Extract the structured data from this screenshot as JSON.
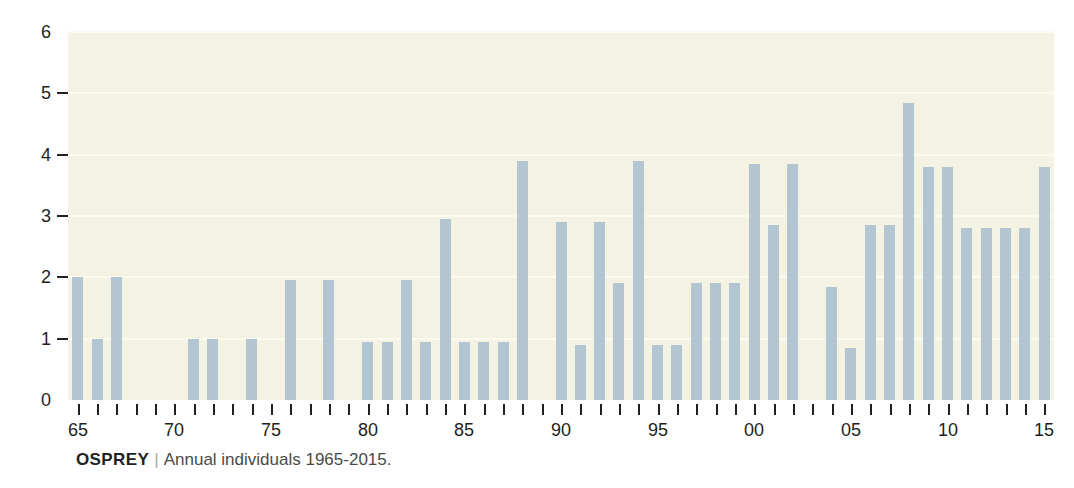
{
  "caption": {
    "species": "OSPREY",
    "separator": "|",
    "description": "Annual individuals 1965-2015."
  },
  "colors": {
    "bar": "#b3c5d0",
    "plot_background": "#f4f3e3",
    "gridline": "#fbfaf0",
    "axis_text": "#231f20",
    "page_background": "#ffffff"
  },
  "chart_data": {
    "type": "bar",
    "xlabel": "",
    "ylabel": "",
    "ylim": [
      0,
      6
    ],
    "yticks": [
      0,
      1,
      2,
      3,
      4,
      5,
      6
    ],
    "ytick_labels": [
      "0",
      "1",
      "2",
      "3",
      "4",
      "5",
      "6"
    ],
    "grid": true,
    "grid_axis": "y",
    "legend": false,
    "xtick_labels": [
      "65",
      "70",
      "75",
      "80",
      "85",
      "90",
      "95",
      "00",
      "05",
      "10",
      "15"
    ],
    "xtick_years": [
      1965,
      1970,
      1975,
      1980,
      1985,
      1990,
      1995,
      2000,
      2005,
      2010,
      2015
    ],
    "x_minor_ticks_every": 1,
    "categories": [
      1965,
      1966,
      1967,
      1968,
      1969,
      1970,
      1971,
      1972,
      1973,
      1974,
      1975,
      1976,
      1977,
      1978,
      1979,
      1980,
      1981,
      1982,
      1983,
      1984,
      1985,
      1986,
      1987,
      1988,
      1989,
      1990,
      1991,
      1992,
      1993,
      1994,
      1995,
      1996,
      1997,
      1998,
      1999,
      2000,
      2001,
      2002,
      2003,
      2004,
      2005,
      2006,
      2007,
      2008,
      2009,
      2010,
      2011,
      2012,
      2013,
      2014,
      2015
    ],
    "values": [
      2.0,
      1.0,
      2.0,
      0,
      0,
      0,
      1.0,
      1.0,
      0,
      1.0,
      0,
      1.95,
      0,
      1.95,
      0,
      0.95,
      0.95,
      1.95,
      0.95,
      2.95,
      0.95,
      0.95,
      0.95,
      3.9,
      0,
      2.9,
      0.9,
      2.9,
      1.9,
      3.9,
      0.9,
      0.9,
      1.9,
      1.9,
      1.9,
      3.85,
      2.85,
      3.85,
      0,
      1.85,
      0.85,
      2.85,
      2.85,
      4.85,
      3.8,
      3.8,
      2.8,
      2.8,
      2.8,
      2.8,
      3.8
    ]
  }
}
